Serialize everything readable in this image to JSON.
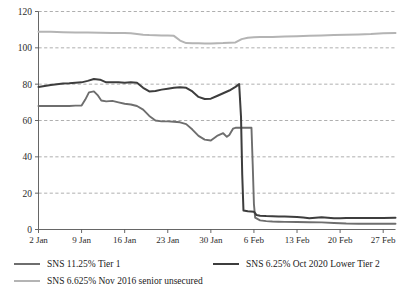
{
  "chart_data": {
    "type": "line",
    "title": "",
    "xlabel": "",
    "ylabel": "",
    "ylim": [
      0,
      120
    ],
    "yticks": [
      0,
      20,
      40,
      60,
      80,
      100,
      120
    ],
    "grid": true,
    "grid_axis": "y",
    "grid_style": "dashed",
    "legend_position": "bottom",
    "x_tick_labels": [
      "2 Jan",
      "9 Jan",
      "16 Jan",
      "23 Jan",
      "30 Jan",
      "6 Feb",
      "13 Feb",
      "20 Feb",
      "27 Feb"
    ],
    "x_tick_days": [
      0,
      7,
      14,
      21,
      28,
      35,
      42,
      49,
      56
    ],
    "xlim_days": [
      0,
      58
    ],
    "series": [
      {
        "name": "SNS 11.25% Tier 1",
        "color": "#6e6e6e",
        "width": 1.9,
        "points": [
          [
            0,
            68.0
          ],
          [
            1,
            68.0
          ],
          [
            2,
            68.0
          ],
          [
            3,
            68.0
          ],
          [
            4,
            68.0
          ],
          [
            5,
            68.0
          ],
          [
            6,
            68.2
          ],
          [
            7,
            68.2
          ],
          [
            7.6,
            71.5
          ],
          [
            8.2,
            75.5
          ],
          [
            9,
            76.0
          ],
          [
            9.6,
            74.0
          ],
          [
            10.2,
            71.0
          ],
          [
            11,
            70.5
          ],
          [
            12,
            70.8
          ],
          [
            13,
            70.0
          ],
          [
            14,
            69.2
          ],
          [
            15,
            68.8
          ],
          [
            16,
            68.0
          ],
          [
            17,
            66.0
          ],
          [
            18,
            62.5
          ],
          [
            19,
            60.0
          ],
          [
            20,
            59.5
          ],
          [
            21,
            59.5
          ],
          [
            22,
            59.3
          ],
          [
            23,
            59.0
          ],
          [
            24,
            58.0
          ],
          [
            25,
            55.0
          ],
          [
            26,
            51.5
          ],
          [
            27,
            49.5
          ],
          [
            28,
            49.0
          ],
          [
            29,
            51.5
          ],
          [
            30,
            53.0
          ],
          [
            30.6,
            51.0
          ],
          [
            31,
            52.0
          ],
          [
            31.6,
            55.5
          ],
          [
            32,
            56.0
          ],
          [
            33,
            56.0
          ],
          [
            34,
            56.0
          ],
          [
            34.6,
            56.0
          ],
          [
            34.8,
            36.0
          ],
          [
            35.0,
            14.0
          ],
          [
            35.2,
            6.5
          ],
          [
            36,
            5.0
          ],
          [
            37,
            4.6
          ],
          [
            38,
            4.4
          ],
          [
            39,
            4.3
          ],
          [
            40,
            4.2
          ],
          [
            42,
            4.1
          ],
          [
            44,
            4.0
          ],
          [
            46,
            3.9
          ],
          [
            48,
            3.6
          ],
          [
            50,
            3.3
          ],
          [
            52,
            3.2
          ],
          [
            54,
            3.2
          ],
          [
            56,
            3.2
          ],
          [
            58,
            3.2
          ]
        ]
      },
      {
        "name": "SNS 6.25% Oct 2020 Lower Tier 2",
        "color": "#3d3d3d",
        "width": 2.0,
        "points": [
          [
            0,
            78.5
          ],
          [
            1,
            79.0
          ],
          [
            2,
            79.5
          ],
          [
            3,
            80.0
          ],
          [
            4,
            80.3
          ],
          [
            5,
            80.5
          ],
          [
            6,
            80.8
          ],
          [
            7,
            81.0
          ],
          [
            8,
            81.8
          ],
          [
            9,
            82.8
          ],
          [
            10,
            82.5
          ],
          [
            11,
            81.0
          ],
          [
            12,
            81.0
          ],
          [
            13,
            81.0
          ],
          [
            14,
            80.8
          ],
          [
            15,
            81.0
          ],
          [
            16,
            80.8
          ],
          [
            17,
            78.0
          ],
          [
            18,
            76.0
          ],
          [
            19,
            76.2
          ],
          [
            20,
            77.0
          ],
          [
            21,
            77.5
          ],
          [
            22,
            78.0
          ],
          [
            23,
            78.3
          ],
          [
            24,
            78.0
          ],
          [
            25,
            76.0
          ],
          [
            26,
            73.0
          ],
          [
            27,
            71.8
          ],
          [
            28,
            72.0
          ],
          [
            29,
            73.5
          ],
          [
            30,
            75.0
          ],
          [
            31,
            76.5
          ],
          [
            32,
            78.5
          ],
          [
            32.6,
            80.0
          ],
          [
            32.9,
            62.0
          ],
          [
            33.1,
            30.0
          ],
          [
            33.3,
            10.5
          ],
          [
            34,
            10.0
          ],
          [
            35,
            9.8
          ],
          [
            35.4,
            8.0
          ],
          [
            36,
            7.6
          ],
          [
            37,
            7.4
          ],
          [
            38,
            7.3
          ],
          [
            39,
            7.2
          ],
          [
            40,
            7.1
          ],
          [
            41,
            7.0
          ],
          [
            42,
            6.9
          ],
          [
            43,
            6.6
          ],
          [
            44,
            6.2
          ],
          [
            45,
            6.5
          ],
          [
            46,
            6.8
          ],
          [
            47,
            6.5
          ],
          [
            48,
            6.2
          ],
          [
            49,
            6.2
          ],
          [
            50,
            6.3
          ],
          [
            52,
            6.3
          ],
          [
            54,
            6.3
          ],
          [
            56,
            6.3
          ],
          [
            58,
            6.4
          ]
        ]
      },
      {
        "name": "SNS 6.625% Nov 2016 senior unsecured",
        "color": "#b4b4b4",
        "width": 2.0,
        "points": [
          [
            0,
            108.8
          ],
          [
            2,
            108.8
          ],
          [
            4,
            108.6
          ],
          [
            6,
            108.5
          ],
          [
            8,
            108.4
          ],
          [
            10,
            108.3
          ],
          [
            12,
            108.2
          ],
          [
            14,
            108.2
          ],
          [
            15,
            108.0
          ],
          [
            16,
            107.6
          ],
          [
            17,
            107.2
          ],
          [
            18,
            107.0
          ],
          [
            19,
            106.9
          ],
          [
            20,
            106.8
          ],
          [
            21,
            106.8
          ],
          [
            22,
            106.6
          ],
          [
            23,
            104.0
          ],
          [
            24,
            102.6
          ],
          [
            25,
            102.5
          ],
          [
            26,
            102.5
          ],
          [
            27,
            102.4
          ],
          [
            28,
            102.4
          ],
          [
            29,
            102.5
          ],
          [
            30,
            102.6
          ],
          [
            31,
            102.8
          ],
          [
            32,
            103.0
          ],
          [
            33,
            104.8
          ],
          [
            34,
            105.6
          ],
          [
            35,
            105.8
          ],
          [
            36,
            105.9
          ],
          [
            38,
            106.0
          ],
          [
            40,
            106.2
          ],
          [
            42,
            106.4
          ],
          [
            44,
            106.6
          ],
          [
            46,
            106.8
          ],
          [
            48,
            107.0
          ],
          [
            50,
            107.2
          ],
          [
            52,
            107.4
          ],
          [
            54,
            107.6
          ],
          [
            56,
            108.0
          ],
          [
            58,
            108.1
          ]
        ]
      }
    ]
  },
  "legend": {
    "items": [
      {
        "label": "SNS 11.25% Tier 1",
        "color": "#6e6e6e"
      },
      {
        "label": "SNS 6.25% Oct 2020 Lower Tier 2",
        "color": "#3d3d3d"
      },
      {
        "label": "SNS 6.625% Nov 2016 senior unsecured",
        "color": "#b4b4b4"
      }
    ]
  },
  "axes": {
    "y_labels": [
      "120",
      "100",
      "80",
      "60",
      "40",
      "20",
      "0"
    ],
    "x_labels": [
      "2 Jan",
      "9 Jan",
      "16 Jan",
      "23 Jan",
      "30 Jan",
      "6 Feb",
      "13 Feb",
      "20 Feb",
      "27 Feb"
    ]
  }
}
